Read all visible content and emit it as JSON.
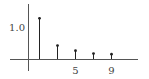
{
  "chart_data": {
    "type": "stem",
    "title": "",
    "xlabel": "",
    "ylabel": "",
    "x": [
      1,
      3,
      5,
      7,
      9
    ],
    "values": [
      1.27,
      0.42,
      0.26,
      0.17,
      0.15
    ],
    "x_ticks": [
      {
        "value": 5,
        "label": "5"
      },
      {
        "value": 9,
        "label": "9"
      }
    ],
    "y_ticks": [
      {
        "value": 1.0,
        "label": "1.0"
      }
    ],
    "xlim": [
      -3,
      13.5
    ],
    "ylim": [
      -0.4,
      1.85
    ],
    "grid": false,
    "legend": "none",
    "colors": {
      "stem": "#222222",
      "axis": "#555555",
      "text": "#444444"
    }
  }
}
